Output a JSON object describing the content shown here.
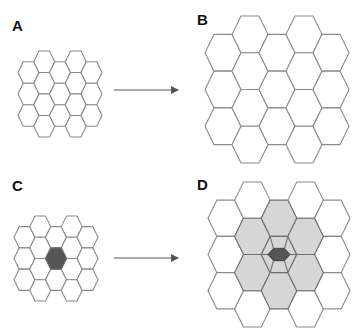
{
  "panels": [
    {
      "id": "A",
      "label": "A",
      "label_pos": [
        12,
        18
      ],
      "grid": {
        "x0": 18,
        "y0": 51,
        "r": 10.5,
        "h": 21.5
      },
      "center_cell": null,
      "neighbors_shaded": false
    },
    {
      "id": "B",
      "label": "B",
      "label_pos": [
        197,
        12
      ],
      "grid": {
        "x0": 205,
        "y0": 16,
        "r": 18,
        "h": 36.75
      },
      "center_cell": null,
      "neighbors_shaded": false
    },
    {
      "id": "C",
      "label": "C",
      "label_pos": [
        12,
        178
      ],
      "grid": {
        "x0": 14,
        "y0": 216,
        "r": 10.5,
        "h": 21.25
      },
      "center_cell": {
        "col": 2,
        "row": 1,
        "scale": 1.0
      },
      "neighbors_shaded": false
    },
    {
      "id": "D",
      "label": "D",
      "label_pos": [
        197,
        177
      ],
      "grid": {
        "x0": 208,
        "y0": 182,
        "r": 17.75,
        "h": 36.25
      },
      "center_cell": {
        "col": 2,
        "row": 1,
        "scale": 0.62
      },
      "neighbors_shaded": true
    }
  ],
  "grid_layout": {
    "columns": 5,
    "hexes_per_column": [
      3,
      4,
      3,
      4,
      3
    ],
    "orientation": "flat-top",
    "offset_columns_down": [
      0,
      2,
      4
    ]
  },
  "arrows": [
    {
      "from": [
        114,
        90
      ],
      "to": [
        178,
        90
      ]
    },
    {
      "from": [
        114,
        258
      ],
      "to": [
        178,
        258
      ]
    }
  ],
  "colors": {
    "stroke": "#8a8a8a",
    "stroke_dark": "#6e6e6e",
    "fill_empty": "#ffffff",
    "fill_shaded": "#d6d6d6",
    "fill_center": "#555555",
    "arrow": "#555555"
  }
}
